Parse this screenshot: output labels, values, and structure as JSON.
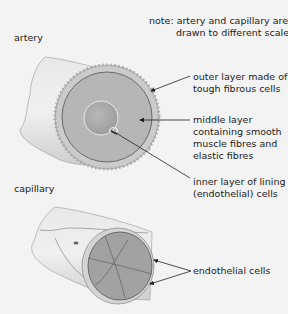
{
  "diagram": {
    "note": {
      "prefix": "note:",
      "line1": "artery and capillary are",
      "line2": "drawn to different scales"
    },
    "sections": [
      {
        "name": "artery",
        "labels": [
          {
            "line1": "outer layer made of",
            "line2": "tough fibrous cells"
          },
          {
            "line1": "middle layer",
            "line2": "containing smooth",
            "line3": "muscle fibres and",
            "line4": "elastic fibres"
          },
          {
            "line1": "inner layer of lining",
            "line2": "(endothelial) cells"
          }
        ]
      },
      {
        "name": "capillary",
        "labels": [
          {
            "line1": "endothelial cells"
          }
        ]
      }
    ],
    "colors": {
      "background": "#f3f3f3",
      "tube_outer": "#dcdcdc",
      "outer_layer": "#c8c8c8",
      "middle_layer": "#b4b4b4",
      "lumen": "#a8a8a8",
      "capillary_inside": "#9e9e9e",
      "lines": "#333333"
    }
  }
}
